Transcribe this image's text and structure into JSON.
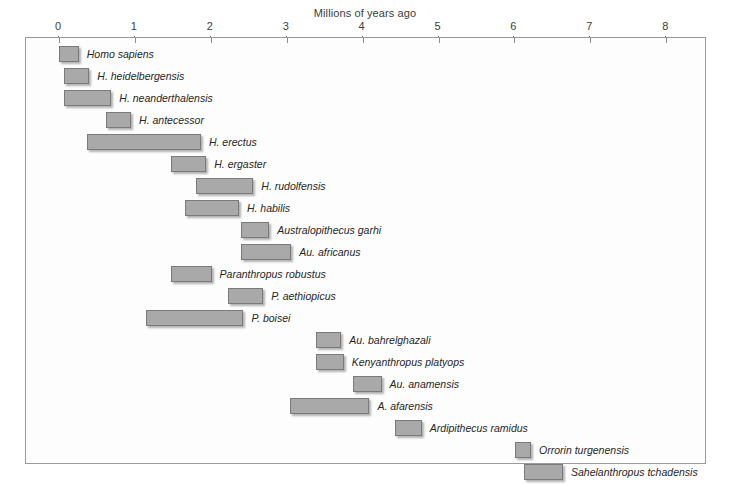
{
  "chart_data": {
    "type": "bar",
    "orientation": "horizontal-range",
    "title": "Millions of years ago",
    "xlabel": "Millions of years ago",
    "ylabel": "",
    "xlim": [
      0,
      8.55
    ],
    "xticks": [
      0,
      1,
      2,
      3,
      4,
      5,
      6,
      7,
      8
    ],
    "xtick_labels": [
      "0",
      "1",
      "2",
      "3",
      "4",
      "5",
      "6",
      "7",
      "8"
    ],
    "grid": false,
    "legend": "none",
    "x_axis_direction": "left-to-right increasing (ticks at top)",
    "bar_color": "#a9a9a9",
    "bar_border_color": "#7a7a7a",
    "frame_color": "#9a9a9a",
    "categories": [
      "Homo sapiens",
      "H. heidelbergensis",
      "H. neanderthalensis",
      "H. antecessor",
      "H. erectus",
      "H. ergaster",
      "H. rudolfensis",
      "H. habilis",
      "Australopithecus garhi",
      "Au. africanus",
      "Paranthropus robustus",
      "P. aethiopicus",
      "P. boisei",
      "Au. bahrelghazali",
      "Kenyanthropus platyops",
      "Au. anamensis",
      "A. afarensis",
      "Ardipithecus ramidus",
      "Orrorin turgenensis",
      "Sahelanthropus tchadensis"
    ],
    "ranges": [
      {
        "label": "Homo sapiens",
        "start": 0.0,
        "end": 0.26,
        "label_side": "right"
      },
      {
        "label": "H. heidelbergensis",
        "start": 0.06,
        "end": 0.4,
        "label_side": "right"
      },
      {
        "label": "H. neanderthalensis",
        "start": 0.06,
        "end": 0.69,
        "label_side": "right"
      },
      {
        "label": "H. antecessor",
        "start": 0.62,
        "end": 0.95,
        "label_side": "right"
      },
      {
        "label": "H. erectus",
        "start": 0.37,
        "end": 1.87,
        "label_side": "right"
      },
      {
        "label": "H. ergaster",
        "start": 1.48,
        "end": 1.94,
        "label_side": "right"
      },
      {
        "label": "H. rudolfensis",
        "start": 1.81,
        "end": 2.56,
        "label_side": "right"
      },
      {
        "label": "H. habilis",
        "start": 1.66,
        "end": 2.37,
        "label_side": "right"
      },
      {
        "label": "Australopithecus garhi",
        "start": 2.4,
        "end": 2.77,
        "label_side": "right"
      },
      {
        "label": "Au. africanus",
        "start": 2.4,
        "end": 3.06,
        "label_side": "right"
      },
      {
        "label": "Paranthropus robustus",
        "start": 1.48,
        "end": 2.01,
        "label_side": "right"
      },
      {
        "label": "P. aethiopicus",
        "start": 2.23,
        "end": 2.69,
        "label_side": "right"
      },
      {
        "label": "P. boisei",
        "start": 1.15,
        "end": 2.43,
        "label_side": "right"
      },
      {
        "label": "Au. bahrelghazali",
        "start": 3.38,
        "end": 3.72,
        "label_side": "right"
      },
      {
        "label": "Kenyanthropus platyops",
        "start": 3.38,
        "end": 3.75,
        "label_side": "right"
      },
      {
        "label": "Au. anamensis",
        "start": 3.88,
        "end": 4.25,
        "label_side": "right"
      },
      {
        "label": "A. afarensis",
        "start": 3.05,
        "end": 4.09,
        "label_side": "right"
      },
      {
        "label": "Ardipithecus ramidus",
        "start": 4.43,
        "end": 4.78,
        "label_side": "right"
      },
      {
        "label": "Orrorin turgenensis",
        "start": 6.01,
        "end": 6.22,
        "label_side": "right"
      },
      {
        "label": "Sahelanthropus tchadensis",
        "start": 6.12,
        "end": 6.64,
        "label_side": "right"
      }
    ]
  }
}
